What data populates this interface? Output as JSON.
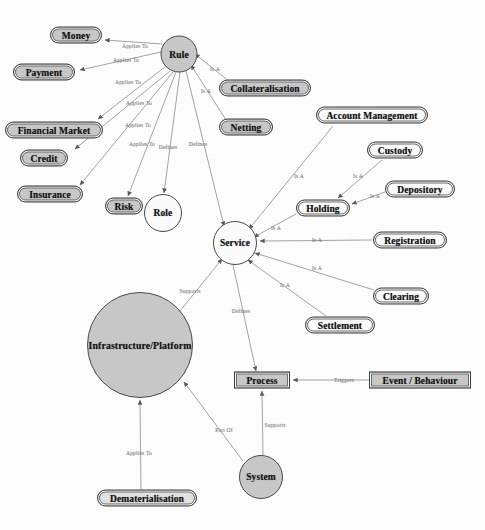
{
  "diagram": {
    "background_color": "#ffffff",
    "node_fill_grey": "#c9c9c9",
    "node_fill_white": "#fdfdfd",
    "edge_color": "#9a9a9a",
    "text_color": "#111111",
    "label_color": "#7d7d7d"
  },
  "nodes": [
    {
      "id": "money",
      "label": "Money",
      "shape": "rounded",
      "fill": "grey",
      "x": 76,
      "y": 35,
      "w": 52,
      "h": 17,
      "fs": 9.5
    },
    {
      "id": "payment",
      "label": "Payment",
      "shape": "rounded",
      "fill": "grey",
      "x": 44,
      "y": 72,
      "w": 62,
      "h": 17,
      "fs": 9.5
    },
    {
      "id": "financial",
      "label": "Financial Market",
      "shape": "rounded",
      "fill": "grey",
      "x": 54,
      "y": 130,
      "w": 98,
      "h": 17,
      "fs": 9.5
    },
    {
      "id": "credit",
      "label": "Credit",
      "shape": "rounded",
      "fill": "grey",
      "x": 44,
      "y": 158,
      "w": 48,
      "h": 17,
      "fs": 9.5
    },
    {
      "id": "insurance",
      "label": "Insurance",
      "shape": "rounded",
      "fill": "grey",
      "x": 50,
      "y": 194,
      "w": 66,
      "h": 17,
      "fs": 9.5
    },
    {
      "id": "risk",
      "label": "Risk",
      "shape": "rounded",
      "fill": "grey",
      "x": 124,
      "y": 206,
      "w": 38,
      "h": 17,
      "fs": 9.5
    },
    {
      "id": "role",
      "label": "Role",
      "shape": "circle",
      "fill": "white",
      "x": 163,
      "y": 213,
      "w": 38,
      "h": 38,
      "fs": 9.5
    },
    {
      "id": "rule",
      "label": "Rule",
      "shape": "circle",
      "fill": "grey",
      "x": 179,
      "y": 54,
      "w": 37,
      "h": 37,
      "fs": 9.5
    },
    {
      "id": "collateral",
      "label": "Collateralisation",
      "shape": "rounded",
      "fill": "grey",
      "x": 265,
      "y": 88,
      "w": 92,
      "h": 17,
      "fs": 9.5
    },
    {
      "id": "netting",
      "label": "Netting",
      "shape": "rounded",
      "fill": "grey",
      "x": 246,
      "y": 127,
      "w": 54,
      "h": 17,
      "fs": 9.5
    },
    {
      "id": "account",
      "label": "Account Management",
      "shape": "rounded",
      "fill": "white",
      "x": 372,
      "y": 115,
      "w": 112,
      "h": 17,
      "fs": 9.5
    },
    {
      "id": "custody",
      "label": "Custody",
      "shape": "rounded",
      "fill": "white",
      "x": 395,
      "y": 150,
      "w": 56,
      "h": 17,
      "fs": 9.5
    },
    {
      "id": "depository",
      "label": "Depository",
      "shape": "rounded",
      "fill": "white",
      "x": 420,
      "y": 189,
      "w": 70,
      "h": 17,
      "fs": 9.5
    },
    {
      "id": "holding",
      "label": "Holding",
      "shape": "rounded",
      "fill": "white",
      "x": 323,
      "y": 208,
      "w": 54,
      "h": 17,
      "fs": 9.5
    },
    {
      "id": "registration",
      "label": "Registration",
      "shape": "rounded",
      "fill": "white",
      "x": 410,
      "y": 240,
      "w": 74,
      "h": 17,
      "fs": 9.5
    },
    {
      "id": "clearing",
      "label": "Clearing",
      "shape": "rounded",
      "fill": "white",
      "x": 401,
      "y": 296,
      "w": 56,
      "h": 17,
      "fs": 9.5
    },
    {
      "id": "settlement",
      "label": "Settlement",
      "shape": "rounded",
      "fill": "white",
      "x": 340,
      "y": 325,
      "w": 70,
      "h": 17,
      "fs": 9.5
    },
    {
      "id": "service",
      "label": "Service",
      "shape": "circle",
      "fill": "white",
      "x": 235,
      "y": 243,
      "w": 44,
      "h": 44,
      "fs": 9.5
    },
    {
      "id": "infrastructure",
      "label": "Infrastructure/Platform",
      "shape": "circle",
      "fill": "grey",
      "x": 140,
      "y": 345,
      "w": 106,
      "h": 106,
      "fs": 9.8
    },
    {
      "id": "process",
      "label": "Process",
      "shape": "rect",
      "fill": "grey",
      "x": 262,
      "y": 380,
      "w": 56,
      "h": 17,
      "fs": 9.5
    },
    {
      "id": "event",
      "label": "Event / Behaviour",
      "shape": "rect",
      "fill": "grey",
      "x": 420,
      "y": 380,
      "w": 102,
      "h": 17,
      "fs": 9.5
    },
    {
      "id": "system",
      "label": "System",
      "shape": "circle",
      "fill": "grey",
      "x": 261,
      "y": 477,
      "w": 44,
      "h": 44,
      "fs": 9.5
    },
    {
      "id": "dematerial",
      "label": "Dematerialisation",
      "shape": "rounded",
      "fill": "light",
      "x": 147,
      "y": 498,
      "w": 100,
      "h": 17,
      "fs": 9.5
    }
  ],
  "edges": [
    {
      "id": "rule-money",
      "from": "rule",
      "to": "money",
      "label": "Applies To",
      "lx": 135,
      "ly": 46,
      "x1": 162,
      "y1": 44,
      "x2": 105,
      "y2": 40
    },
    {
      "id": "rule-payment",
      "from": "rule",
      "to": "payment",
      "label": "Applies To",
      "lx": 126,
      "ly": 60,
      "x1": 161,
      "y1": 52,
      "x2": 80,
      "y2": 70
    },
    {
      "id": "rule-financial",
      "from": "rule",
      "to": "financial",
      "label": "Applies To",
      "lx": 128,
      "ly": 82,
      "x1": 166,
      "y1": 66,
      "x2": 98,
      "y2": 119
    },
    {
      "id": "rule-credit",
      "from": "rule",
      "to": "credit",
      "label": "Applies To",
      "lx": 139,
      "ly": 103,
      "x1": 170,
      "y1": 71,
      "x2": 75,
      "y2": 149
    },
    {
      "id": "rule-insurance",
      "from": "rule",
      "to": "insurance",
      "label": "Applies To",
      "lx": 138,
      "ly": 125,
      "x1": 173,
      "y1": 72,
      "x2": 80,
      "y2": 185
    },
    {
      "id": "rule-risk",
      "from": "rule",
      "to": "risk",
      "label": "Applies To",
      "lx": 142,
      "ly": 144,
      "x1": 176,
      "y1": 72,
      "x2": 128,
      "y2": 196
    },
    {
      "id": "rule-role",
      "from": "rule",
      "to": "role",
      "label": "Defines",
      "lx": 168,
      "ly": 147,
      "x1": 180,
      "y1": 72,
      "x2": 164,
      "y2": 193
    },
    {
      "id": "rule-service",
      "from": "rule",
      "to": "service",
      "label": "Defines",
      "lx": 198,
      "ly": 144,
      "x1": 186,
      "y1": 71,
      "x2": 224,
      "y2": 226
    },
    {
      "id": "collateral-rule",
      "from": "collateral",
      "to": "rule",
      "label": "Is A",
      "lx": 215,
      "ly": 69,
      "x1": 230,
      "y1": 82,
      "x2": 195,
      "y2": 54
    },
    {
      "id": "netting-rule",
      "from": "netting",
      "to": "rule",
      "label": "Is A",
      "lx": 206,
      "ly": 91,
      "x1": 226,
      "y1": 120,
      "x2": 191,
      "y2": 65
    },
    {
      "id": "account-service",
      "from": "account",
      "to": "service",
      "label": "Is A",
      "lx": 299,
      "ly": 176,
      "x1": 333,
      "y1": 126,
      "x2": 249,
      "y2": 229
    },
    {
      "id": "custody-holding",
      "from": "custody",
      "to": "holding",
      "label": "Is A",
      "lx": 358,
      "ly": 176,
      "x1": 382,
      "y1": 160,
      "x2": 338,
      "y2": 198
    },
    {
      "id": "depository-holding",
      "from": "depository",
      "to": "holding",
      "label": "Is A",
      "lx": 375,
      "ly": 196,
      "x1": 385,
      "y1": 192,
      "x2": 352,
      "y2": 204
    },
    {
      "id": "holding-service",
      "from": "holding",
      "to": "service",
      "label": "Is A",
      "lx": 276,
      "ly": 228,
      "x1": 296,
      "y1": 214,
      "x2": 254,
      "y2": 237
    },
    {
      "id": "registration-service",
      "from": "registration",
      "to": "service",
      "label": "Is A",
      "lx": 317,
      "ly": 240,
      "x1": 372,
      "y1": 240,
      "x2": 260,
      "y2": 241
    },
    {
      "id": "clearing-service",
      "from": "clearing",
      "to": "service",
      "label": "Is A",
      "lx": 317,
      "ly": 268,
      "x1": 374,
      "y1": 290,
      "x2": 255,
      "y2": 253
    },
    {
      "id": "settlement-service",
      "from": "settlement",
      "to": "service",
      "label": "Is A",
      "lx": 285,
      "ly": 285,
      "x1": 326,
      "y1": 316,
      "x2": 248,
      "y2": 260
    },
    {
      "id": "infra-service",
      "from": "infrastructure",
      "to": "service",
      "label": "Supports",
      "lx": 190,
      "ly": 291,
      "x1": 176,
      "y1": 316,
      "x2": 222,
      "y2": 259
    },
    {
      "id": "service-process",
      "from": "service",
      "to": "process",
      "label": "Defines",
      "lx": 241,
      "ly": 311,
      "x1": 233,
      "y1": 265,
      "x2": 256,
      "y2": 371
    },
    {
      "id": "event-process",
      "from": "event",
      "to": "process",
      "label": "Triggers",
      "lx": 344,
      "ly": 380,
      "x1": 369,
      "y1": 380,
      "x2": 293,
      "y2": 380
    },
    {
      "id": "system-process",
      "from": "system",
      "to": "process",
      "label": "Supports",
      "lx": 275,
      "ly": 425,
      "x1": 263,
      "y1": 455,
      "x2": 262,
      "y2": 391
    },
    {
      "id": "system-infra",
      "from": "system",
      "to": "infrastructure",
      "label": "Part Of",
      "lx": 224,
      "ly": 430,
      "x1": 243,
      "y1": 461,
      "x2": 184,
      "y2": 382
    },
    {
      "id": "demat-infra",
      "from": "dematerial",
      "to": "infrastructure",
      "label": "Applies To",
      "lx": 139,
      "ly": 453,
      "x1": 141,
      "y1": 489,
      "x2": 140,
      "y2": 400
    }
  ]
}
